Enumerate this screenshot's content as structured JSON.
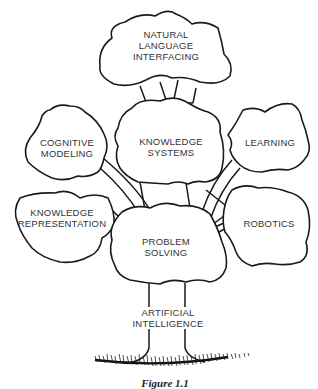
{
  "diagram": {
    "type": "tree",
    "root": {
      "label_lines": [
        "ARTIFICIAL",
        "INTELLIGENCE"
      ]
    },
    "nodes": [
      {
        "id": "natural-language",
        "label_lines": [
          "NATURAL",
          "LANGUAGE",
          "INTERFACING"
        ]
      },
      {
        "id": "cognitive-modeling",
        "label_lines": [
          "COGNITIVE",
          "MODELING"
        ]
      },
      {
        "id": "knowledge-systems",
        "label_lines": [
          "KNOWLEDGE",
          "SYSTEMS"
        ]
      },
      {
        "id": "learning",
        "label_lines": [
          "LEARNING"
        ]
      },
      {
        "id": "knowledge-representation",
        "label_lines": [
          "KNOWLEDGE",
          "REPRESENTATION"
        ]
      },
      {
        "id": "robotics",
        "label_lines": [
          "ROBOTICS"
        ]
      },
      {
        "id": "problem-solving",
        "label_lines": [
          "PROBLEM",
          "SOLVING"
        ]
      }
    ],
    "edges": [
      [
        "artificial-intelligence",
        "problem-solving"
      ],
      [
        "problem-solving",
        "knowledge-representation"
      ],
      [
        "problem-solving",
        "cognitive-modeling"
      ],
      [
        "problem-solving",
        "knowledge-systems"
      ],
      [
        "problem-solving",
        "learning"
      ],
      [
        "problem-solving",
        "robotics"
      ],
      [
        "knowledge-systems",
        "natural-language"
      ]
    ],
    "caption": "Figure 1.1"
  }
}
